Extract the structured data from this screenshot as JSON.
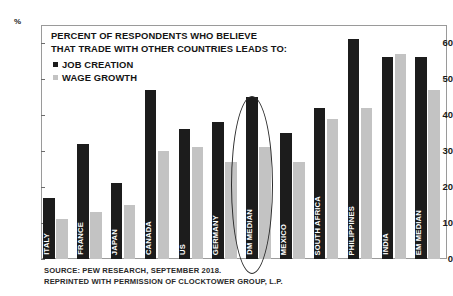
{
  "chart_data": {
    "type": "bar",
    "title": "PERCENT OF RESPONDENTS WHO BELIEVE THAT TRADE WITH OTHER COUNTRIES LEADS TO:",
    "title_line1": "PERCENT OF RESPONDENTS WHO BELIEVE",
    "title_line2": "THAT TRADE WITH OTHER COUNTRIES LEADS TO:",
    "xlabel": "",
    "ylabel": "%",
    "ylim": [
      0,
      65
    ],
    "yticks": [
      0,
      10,
      20,
      30,
      40,
      50,
      60
    ],
    "grid": false,
    "legend_position": "top-left",
    "categories": [
      "ITALY",
      "FRANCE",
      "JAPAN",
      "CANADA",
      "US",
      "GERMANY",
      "DM MEDIAN",
      "MEXICO",
      "SOUTH AFRICA",
      "PHILIPPINES",
      "INDIA",
      "EM MEDIAN"
    ],
    "series": [
      {
        "name": "JOB CREATION",
        "color": "#1c1c1c",
        "values": [
          17,
          32,
          21,
          47,
          36,
          38,
          45,
          35,
          42,
          61,
          56,
          56
        ]
      },
      {
        "name": "WAGE GROWTH",
        "color": "#c3c3c3",
        "values": [
          11,
          13,
          15,
          30,
          31,
          27,
          31,
          27,
          39,
          42,
          57,
          47
        ]
      }
    ],
    "annotations": [
      {
        "type": "ellipse",
        "target_category": "DM MEDIAN",
        "label": "dm-median-highlight"
      }
    ]
  },
  "footer": {
    "line1": "SOURCE: PEW RESEARCH, SEPTEMBER 2018.",
    "line2": "REPRINTED WITH PERMISSION OF CLOCKTOWER GROUP, L.P."
  }
}
